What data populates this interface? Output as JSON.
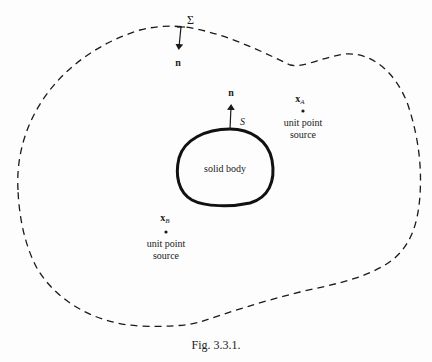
{
  "figure": {
    "caption": "Fig. 3.3.1.",
    "outer_surface": {
      "label": "Σ",
      "normal_label": "n",
      "style": "dashed"
    },
    "body": {
      "label": "solid body",
      "surface_label": "S",
      "normal_label": "n"
    },
    "point_a": {
      "symbol": "x",
      "subscript": "A",
      "line1": "unit point",
      "line2": "source"
    },
    "point_b": {
      "symbol": "x",
      "subscript": "B",
      "line1": "unit point",
      "line2": "source"
    },
    "colors": {
      "ink": "#1a1a1a",
      "background": "#fdfdfd"
    }
  }
}
